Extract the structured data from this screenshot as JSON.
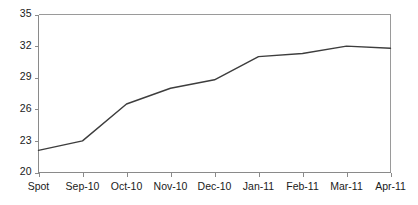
{
  "chart_data": {
    "type": "line",
    "title": "",
    "subtitle": "",
    "xlabel": "",
    "ylabel": "",
    "categories": [
      "Spot",
      "Sep-10",
      "Oct-10",
      "Nov-10",
      "Dec-10",
      "Jan-11",
      "Feb-11",
      "Mar-11",
      "Apr-11"
    ],
    "values": [
      22.1,
      23.0,
      26.5,
      28.0,
      28.8,
      31.0,
      31.3,
      32.0,
      31.8
    ],
    "series": [
      {
        "name": "",
        "values": [
          22.1,
          23.0,
          26.5,
          28.0,
          28.8,
          31.0,
          31.3,
          32.0,
          31.8
        ]
      }
    ],
    "ylim": [
      20,
      35
    ],
    "xlim": [
      0,
      8
    ],
    "yticks": [
      20,
      23,
      26,
      29,
      32,
      35
    ],
    "ytick_labels": [
      "20",
      "23",
      "26",
      "29",
      "32",
      "35"
    ],
    "xtick_labels": [
      "Spot",
      "Sep-10",
      "Oct-10",
      "Nov-10",
      "Dec-10",
      "Jan-11",
      "Feb-11",
      "Mar-11",
      "Apr-11"
    ],
    "grid": false,
    "legend": false,
    "legend_position": "none",
    "annotations": [],
    "colors": {
      "line": "#3d3d3d",
      "axis": "#8a8a8a",
      "frame": "#9a9a9a",
      "text": "#1a1a1a",
      "background": "#ffffff"
    }
  }
}
